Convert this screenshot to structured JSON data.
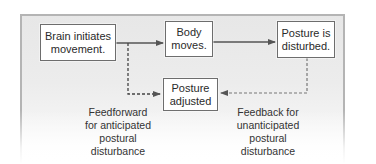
{
  "diagram": {
    "type": "flowchart",
    "colors": {
      "panel_background": "#e9e9e9",
      "panel_border": "#b4b4b4",
      "box_border": "#6d6d6d",
      "arrow": "#555555",
      "text": "#2a2a2a"
    },
    "nodes": [
      {
        "id": "brain",
        "lines": [
          "Brain initiates",
          "movement."
        ]
      },
      {
        "id": "body",
        "lines": [
          "Body",
          "moves."
        ]
      },
      {
        "id": "disturbed",
        "lines": [
          "Posture is",
          "disturbed."
        ]
      },
      {
        "id": "adjusted",
        "lines": [
          "Posture",
          "adjusted"
        ]
      }
    ],
    "edges": [
      {
        "from": "brain",
        "to": "body",
        "style": "solid"
      },
      {
        "from": "body",
        "to": "disturbed",
        "style": "solid"
      },
      {
        "from": "brain",
        "to": "adjusted",
        "style": "dashed",
        "label": "feedforward"
      },
      {
        "from": "disturbed",
        "to": "adjusted",
        "style": "dashed",
        "label": "feedback"
      }
    ],
    "labels": {
      "feedforward": [
        "Feedforward",
        "for anticipated",
        "postural",
        "disturbance"
      ],
      "feedback": [
        "Feedback for",
        "unanticipated",
        "postural",
        "disturbance"
      ]
    }
  }
}
